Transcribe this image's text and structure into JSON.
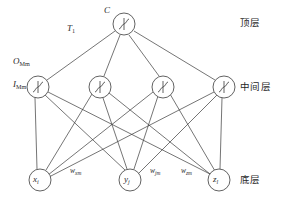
{
  "diagram": {
    "stroke_color": "#3a3a3a",
    "node_fill": "#ffffff",
    "text_color": "#2b2b2b"
  },
  "layers": [
    {
      "key": "top",
      "label": "顶层",
      "node_count": 1
    },
    {
      "key": "middle",
      "label": "中间层",
      "node_count": 4
    },
    {
      "key": "bottom",
      "label": "底层",
      "node_count": 3
    }
  ],
  "nodes": {
    "top": [
      {
        "id": "top-1",
        "glyph": "f",
        "cx": 124,
        "cy": 24,
        "r": 11
      }
    ],
    "middle": [
      {
        "id": "mid-1",
        "glyph": "f",
        "cx": 38,
        "cy": 87,
        "r": 11
      },
      {
        "id": "mid-2",
        "glyph": "f",
        "cx": 100,
        "cy": 87,
        "r": 11
      },
      {
        "id": "mid-3",
        "glyph": "f",
        "cx": 163,
        "cy": 87,
        "r": 11
      },
      {
        "id": "mid-4",
        "glyph": "f",
        "cx": 224,
        "cy": 87,
        "r": 11
      }
    ],
    "bottom": [
      {
        "id": "bot-1",
        "base": "x",
        "sub": "i",
        "cx": 40,
        "cy": 180,
        "r": 11
      },
      {
        "id": "bot-2",
        "base": "y",
        "sub": "j",
        "cx": 130,
        "cy": 180,
        "r": 11
      },
      {
        "id": "bot-3",
        "base": "z",
        "sub": "l",
        "cx": 219,
        "cy": 180,
        "r": 11
      }
    ]
  },
  "annotations": {
    "top_node_label": {
      "base": "C",
      "sub": ""
    },
    "threshold_label": {
      "base": "T",
      "sub": "1"
    },
    "output_label": {
      "base": "O",
      "sub": "Mm"
    },
    "input_label": {
      "base": "I",
      "sub": "Mm"
    },
    "weights": [
      {
        "id": "w-xm",
        "base": "w",
        "sub": "xm",
        "x": 70,
        "y": 167
      },
      {
        "id": "w-jm",
        "base": "w",
        "sub": "jm",
        "x": 150,
        "y": 167
      },
      {
        "id": "w-zm",
        "base": "w",
        "sub": "zm",
        "x": 181,
        "y": 167
      }
    ]
  },
  "layer_labels": {
    "top": {
      "text": "顶层",
      "x": 240,
      "y": 18
    },
    "middle": {
      "text": "中间层",
      "x": 240,
      "y": 82
    },
    "bottom": {
      "text": "底层",
      "x": 240,
      "y": 175
    }
  }
}
